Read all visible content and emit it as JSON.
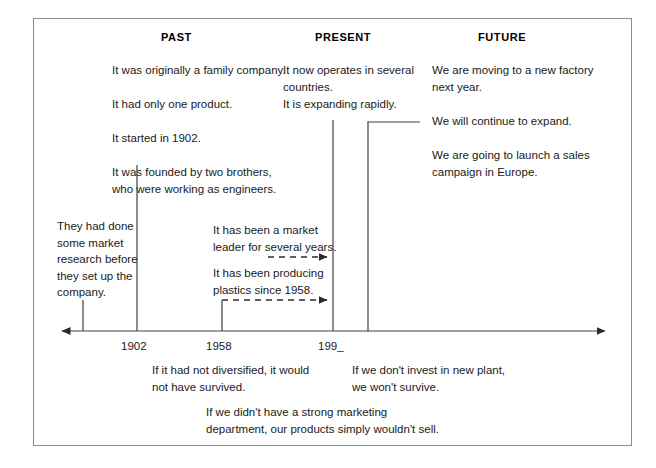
{
  "diagram": {
    "type": "timeline",
    "title": "",
    "headers": [
      {
        "label": "PAST",
        "x": 161,
        "y": 31
      },
      {
        "label": "PRESENT",
        "x": 315,
        "y": 31
      },
      {
        "label": "FUTURE",
        "x": 478,
        "y": 31
      }
    ],
    "axis": {
      "y": 331,
      "x_start": 62,
      "x_end": 612,
      "left_arrow": true,
      "right_arrow": true,
      "ticks": [
        {
          "label": "",
          "x": 83,
          "has_label": false
        },
        {
          "label": "1902",
          "x": 137,
          "has_label": true
        },
        {
          "label": "1958",
          "x": 222,
          "has_label": true
        },
        {
          "label": "199_",
          "x": 333,
          "has_label": true
        },
        {
          "label": "",
          "x": 368,
          "has_label": false
        }
      ],
      "tick_labels": [
        {
          "text": "1902",
          "x": 121,
          "y": 340
        },
        {
          "text": "1958",
          "x": 206,
          "y": 340
        },
        {
          "text": "199_",
          "x": 318,
          "y": 340
        }
      ]
    },
    "text_blocks": [
      {
        "id": "past-main",
        "text": "It was originally a family company.\n\nIt had only one product.\n\nIt started in 1902.\n\nIt was founded by two brothers,\nwho were working as engineers.",
        "x": 112,
        "y": 62,
        "width": 200
      },
      {
        "id": "present-main",
        "text": "It now operates in several\ncountries.\nIt is expanding rapidly.",
        "x": 283,
        "y": 62,
        "width": 150
      },
      {
        "id": "future-main",
        "text": "We are moving to a new factory\nnext year.\n\nWe will continue to expand.\n\nWe are going to launch a sales\ncampaign in Europe.",
        "x": 432,
        "y": 62,
        "width": 185
      },
      {
        "id": "past-perfect",
        "text": "They had done\nsome market\nresearch before\nthey set up the\ncompany.",
        "x": 57,
        "y": 218,
        "width": 90
      },
      {
        "id": "present-perfect-1",
        "text": "It has been a market\nleader for several years.",
        "x": 213,
        "y": 222,
        "width": 130
      },
      {
        "id": "present-perfect-2",
        "text": "It has been producing\nplastics since 1958.",
        "x": 213,
        "y": 265,
        "width": 130
      },
      {
        "id": "conditional-3",
        "text": "If it had not diversified, it would\nnot have survived.",
        "x": 152,
        "y": 362,
        "width": 190
      },
      {
        "id": "conditional-1",
        "text": "If we don't invest in new plant,\nwe won't survive.",
        "x": 352,
        "y": 362,
        "width": 180
      },
      {
        "id": "conditional-2",
        "text": "If we didn't have a strong marketing\ndepartment, our products simply wouldn't sell.",
        "x": 206,
        "y": 404,
        "width": 300
      }
    ],
    "connectors": [
      {
        "id": "line-1902",
        "type": "vertical-solid",
        "x": 137,
        "y_top": 165,
        "y_bottom": 331
      },
      {
        "id": "line-past",
        "type": "vertical-solid",
        "x": 83,
        "y_top": 300,
        "y_bottom": 331
      },
      {
        "id": "line-1958",
        "type": "vertical-solid",
        "x": 222,
        "y_top": 300,
        "y_bottom": 331
      },
      {
        "id": "line-199",
        "type": "vertical-solid",
        "x": 333,
        "y_top": 120,
        "y_bottom": 331
      },
      {
        "id": "line-future",
        "type": "vertical-solid",
        "x": 368,
        "y_top": 122,
        "y_bottom": 331
      },
      {
        "id": "bracket-future",
        "type": "horizontal-solid",
        "y": 122,
        "x_start": 368,
        "x_end": 420
      },
      {
        "id": "arrow-market-leader",
        "type": "dashed-arrow",
        "y": 257,
        "x_start": 268,
        "x_end": 333
      },
      {
        "id": "arrow-plastics",
        "type": "dashed-arrow",
        "y": 300,
        "x_start": 222,
        "x_end": 333
      }
    ],
    "colors": {
      "border": "#8c8c8c",
      "line": "#404040",
      "text": "#1a1a1a",
      "background": "#ffffff"
    }
  }
}
